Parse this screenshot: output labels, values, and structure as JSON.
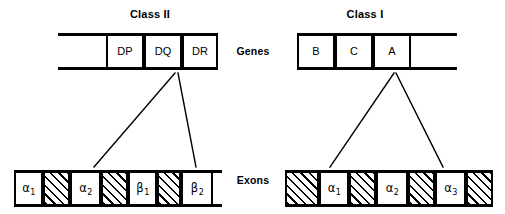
{
  "figure": {
    "panels": [
      {
        "id": "class-ii",
        "title": "Class II",
        "genes_row": {
          "label": "Genes",
          "segments": [
            {
              "kind": "spacer",
              "label": "",
              "width": 48
            },
            {
              "kind": "box",
              "label": "DP",
              "width": 38
            },
            {
              "kind": "box",
              "label": "DQ",
              "width": 38
            },
            {
              "kind": "box",
              "label": "DR",
              "width": 36
            }
          ]
        },
        "exons_row": {
          "label": "Exons",
          "segments": [
            {
              "kind": "box",
              "label": "α",
              "sub": "1",
              "width": 29
            },
            {
              "kind": "hatch",
              "label": "",
              "sub": "",
              "width": 27
            },
            {
              "kind": "box",
              "label": "α",
              "sub": "2",
              "width": 31
            },
            {
              "kind": "hatch",
              "label": "",
              "sub": "",
              "width": 27
            },
            {
              "kind": "box",
              "label": "β",
              "sub": "1",
              "width": 29
            },
            {
              "kind": "hatch",
              "label": "",
              "sub": "",
              "width": 24
            },
            {
              "kind": "box",
              "label": "β",
              "sub": "2",
              "width": 32
            },
            {
              "kind": "spacer",
              "label": "",
              "sub": "",
              "width": 9
            }
          ]
        }
      },
      {
        "id": "class-i",
        "title": "Class I",
        "genes_row": {
          "label": "Genes",
          "segments": [
            {
              "kind": "box",
              "label": "B",
              "width": 38
            },
            {
              "kind": "box",
              "label": "C",
              "width": 38
            },
            {
              "kind": "box",
              "label": "A",
              "width": 38
            },
            {
              "kind": "spacer",
              "label": "",
              "width": 46
            }
          ]
        },
        "exons_row": {
          "label": "Exons",
          "segments": [
            {
              "kind": "hatch",
              "label": "",
              "sub": "",
              "width": 34
            },
            {
              "kind": "box",
              "label": "α",
              "sub": "1",
              "width": 30
            },
            {
              "kind": "hatch",
              "label": "",
              "sub": "",
              "width": 27
            },
            {
              "kind": "box",
              "label": "α",
              "sub": "2",
              "width": 32
            },
            {
              "kind": "hatch",
              "label": "",
              "sub": "",
              "width": 27
            },
            {
              "kind": "box",
              "label": "α",
              "sub": "3",
              "width": 31
            },
            {
              "kind": "hatch",
              "label": "",
              "sub": "",
              "width": 27
            }
          ]
        }
      }
    ],
    "connectors": {
      "class_ii": {
        "from_gene": "DR",
        "lines": [
          {
            "x1": 175,
            "y1": 73,
            "x2": 94,
            "y2": 167
          },
          {
            "x1": 178,
            "y1": 73,
            "x2": 196,
            "y2": 167
          }
        ]
      },
      "class_i": {
        "from_gene": "A",
        "lines": [
          {
            "x1": 394,
            "y1": 73,
            "x2": 330,
            "y2": 167
          },
          {
            "x1": 396,
            "y1": 73,
            "x2": 443,
            "y2": 167
          }
        ]
      }
    },
    "colors": {
      "ink": "#000000",
      "paper": "#ffffff"
    }
  }
}
